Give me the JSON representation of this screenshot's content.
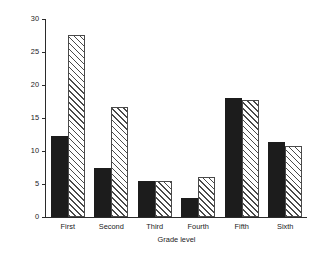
{
  "chart_data": {
    "type": "bar",
    "title": "",
    "xlabel": "Grade level",
    "ylabel": "I.Q. Increase (points)",
    "categories": [
      "First",
      "Second",
      "Third",
      "Fourth",
      "Fifth",
      "Sixth"
    ],
    "series": [
      {
        "name": "solid",
        "fill": "solid-black",
        "values": [
          12.2,
          7.4,
          5.4,
          2.9,
          18.0,
          11.4
        ]
      },
      {
        "name": "hatched",
        "fill": "diagonal-hatch",
        "values": [
          27.6,
          16.7,
          5.4,
          6.1,
          17.8,
          10.7
        ]
      }
    ],
    "ylim": [
      0,
      30
    ],
    "yticks": [
      0,
      5,
      10,
      15,
      20,
      25,
      30
    ],
    "ytick_labels": [
      "0",
      "5",
      "10",
      "15",
      "20",
      "25",
      "30"
    ],
    "grid": false,
    "legend": "none",
    "colors": {
      "solid_bar": "#1c1c1c",
      "hatch_line": "#4a4a4a",
      "hatch_background": "#ffffff",
      "axis": "#2b2b2b",
      "background": "#ffffff"
    }
  }
}
